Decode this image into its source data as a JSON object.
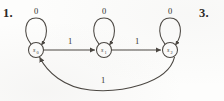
{
  "figure": {
    "type": "finite-state-machine-diagram",
    "exercise_number_left": "1.",
    "exercise_number_right": "3.",
    "stroke_color": "#4a4641",
    "text_color": "#312e2a",
    "background_color": "#fdfdfc"
  },
  "states": [
    {
      "id": "s0",
      "base": "s",
      "subscript": "0",
      "label": "s0",
      "cx": 36,
      "cy": 50,
      "r": 7.5
    },
    {
      "id": "s1",
      "base": "s",
      "subscript": "1",
      "label": "s1",
      "cx": 104,
      "cy": 50,
      "r": 7.5
    },
    {
      "id": "s2",
      "base": "s",
      "subscript": "2",
      "label": "s2",
      "cx": 170,
      "cy": 50,
      "r": 7.5
    }
  ],
  "self_loops": [
    {
      "state": "s0",
      "label": "0",
      "label_x": 36,
      "label_y": 11
    },
    {
      "state": "s1",
      "label": "0",
      "label_x": 104,
      "label_y": 11
    },
    {
      "state": "s2",
      "label": "0",
      "label_x": 170,
      "label_y": 11
    }
  ],
  "transitions": [
    {
      "from": "s0",
      "to": "s1",
      "label": "1",
      "label_x": 70,
      "label_y": 41,
      "shape": "straight"
    },
    {
      "from": "s1",
      "to": "s2",
      "label": "1",
      "label_x": 137,
      "label_y": 41,
      "shape": "straight"
    },
    {
      "from": "s2",
      "to": "s0",
      "label": "1",
      "label_x": 103,
      "label_y": 86,
      "shape": "arc-below"
    }
  ],
  "alphabet": [
    "0",
    "1"
  ]
}
